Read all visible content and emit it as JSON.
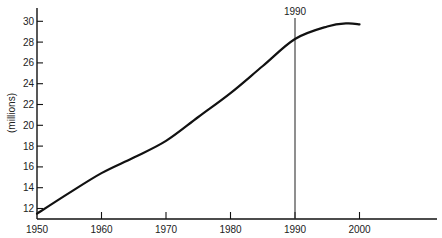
{
  "chart_data": {
    "type": "line",
    "title": "",
    "xlabel": "",
    "ylabel": "(millions)",
    "xlim": [
      1950,
      2010
    ],
    "ylim": [
      11,
      31
    ],
    "x_ticks": [
      1950,
      1960,
      1970,
      1980,
      1990,
      2000
    ],
    "y_ticks": [
      12,
      14,
      16,
      18,
      20,
      22,
      24,
      26,
      28,
      30
    ],
    "grid": false,
    "legend": null,
    "x": [
      1950,
      1955,
      1960,
      1965,
      1970,
      1975,
      1980,
      1985,
      1990,
      1995,
      1998,
      2000
    ],
    "series": [
      {
        "name": "Population",
        "values": [
          11.5,
          13.5,
          15.4,
          16.9,
          18.5,
          20.8,
          23.1,
          25.7,
          28.3,
          29.5,
          29.8,
          29.7
        ]
      }
    ],
    "annotations": [
      {
        "type": "vertical-line",
        "x": 1990,
        "label": "1990"
      }
    ]
  }
}
